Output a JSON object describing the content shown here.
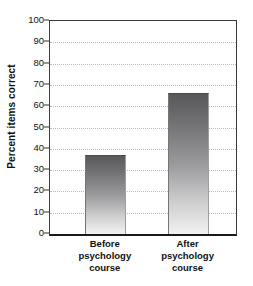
{
  "chart_data": {
    "type": "bar",
    "title": "",
    "subtitle": "",
    "xlabel": "",
    "ylabel": "Percent items correct",
    "ylim": [
      0,
      100
    ],
    "ytick_step": 10,
    "ytick_labels": [
      "100",
      "90",
      "80",
      "70",
      "60",
      "50",
      "40",
      "30",
      "20",
      "10",
      "0"
    ],
    "ytick_values": [
      100,
      90,
      80,
      70,
      60,
      50,
      40,
      30,
      20,
      10,
      0
    ],
    "grid": true,
    "grid_axis": "y",
    "grid_style": "dotted",
    "legend": false,
    "legend_position": "none",
    "categories": [
      "Before psychology course",
      "After psychology course"
    ],
    "category_lines": [
      [
        "Before",
        "psychology",
        "course"
      ],
      [
        "After",
        "psychology",
        "course"
      ]
    ],
    "values": [
      37,
      66
    ],
    "series": [
      {
        "name": "Percent items correct",
        "values": [
          37,
          66
        ]
      }
    ],
    "annotations": []
  },
  "style": {
    "bar_fill_top": "#58585a",
    "bar_fill_bottom": "#f2f2f2",
    "grid_color": "#b8b8b8",
    "axis_color": "#1a1a1a",
    "frame_color": "#3a3a3a",
    "text_color": "#111111",
    "background": "#ffffff"
  }
}
